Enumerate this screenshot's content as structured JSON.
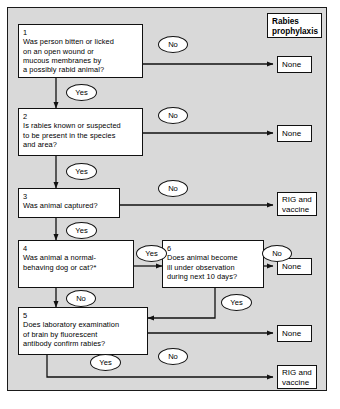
{
  "figure": {
    "background_color": "#d9d9d9",
    "line_color": "#111111",
    "node_fill": "#ffffff"
  },
  "header": {
    "label": "Rabies\nprophylaxis"
  },
  "decisions": [
    {
      "id": "1",
      "number": "1",
      "text": "Was person bitten or licked\non an open wound or\nmucous membranes by\na possibly rabid animal?"
    },
    {
      "id": "2",
      "number": "2",
      "text": "Is rabies known or suspected\nto be present in the species\nand area?"
    },
    {
      "id": "3",
      "number": "3",
      "text": "Was animal captured?"
    },
    {
      "id": "4",
      "number": "4",
      "text": "Was animal a normal-\nbehaving dog or cat?*"
    },
    {
      "id": "5",
      "number": "5",
      "text": "Does laboratory examination\nof brain by fluorescent\nantibody confirm rabies?"
    },
    {
      "id": "6",
      "number": "6",
      "text": "Does animal become\nill under observation\nduring next 10 days?"
    }
  ],
  "outcomes": [
    {
      "id": "o1",
      "label": "None"
    },
    {
      "id": "o2",
      "label": "None"
    },
    {
      "id": "o3",
      "label": "RIG and\nvaccine"
    },
    {
      "id": "o4",
      "label": "None"
    },
    {
      "id": "o5",
      "label": "None"
    },
    {
      "id": "o6",
      "label": "RIG and\nvaccine"
    }
  ],
  "edge_labels": [
    {
      "id": "e1no",
      "label": "No",
      "from": "1",
      "to": "None"
    },
    {
      "id": "e1yes",
      "label": "Yes",
      "from": "1",
      "to": "2"
    },
    {
      "id": "e2no",
      "label": "No",
      "from": "2",
      "to": "None"
    },
    {
      "id": "e2yes",
      "label": "Yes",
      "from": "2",
      "to": "3"
    },
    {
      "id": "e3no",
      "label": "No",
      "from": "3",
      "to": "RIG and vaccine"
    },
    {
      "id": "e3yes",
      "label": "Yes",
      "from": "3",
      "to": "4"
    },
    {
      "id": "e4yes",
      "label": "Yes",
      "from": "4",
      "to": "6"
    },
    {
      "id": "e4no",
      "label": "No",
      "from": "4",
      "to": "5"
    },
    {
      "id": "e6no",
      "label": "No",
      "from": "6",
      "to": "None"
    },
    {
      "id": "e6yes",
      "label": "Yes",
      "from": "6",
      "to": "5"
    },
    {
      "id": "e5no",
      "label": "No",
      "from": "5",
      "to": "None"
    },
    {
      "id": "e5yes",
      "label": "Yes",
      "from": "5",
      "to": "RIG and vaccine"
    }
  ]
}
